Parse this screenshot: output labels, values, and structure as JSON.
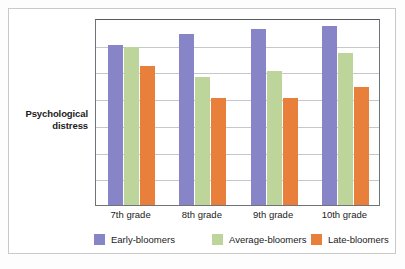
{
  "figure": {
    "background": "#ffffff",
    "frame_color": "#c9c9c9",
    "axis_color": "#6f7276",
    "grid_color": "#c4c8cc"
  },
  "y_axis_label": "Psychological\ndistress",
  "y_axis_label_line1": "Psychological",
  "y_axis_label_line2": "distress",
  "legend": {
    "position": "bottom",
    "items": [
      {
        "label": "Early-bloomers",
        "color": "#8884c8",
        "name": "legend-item-early-bloomers"
      },
      {
        "label": "Average-bloomers",
        "color": "#bdd49a",
        "name": "legend-item-average-bloomers"
      },
      {
        "label": "Late-bloomers",
        "color": "#e8803c",
        "name": "legend-item-late-bloomers"
      }
    ]
  },
  "chart_data": {
    "type": "bar",
    "title": "",
    "xlabel": "",
    "ylabel": "Psychological distress",
    "categories": [
      "7th grade",
      "8th grade",
      "9th grade",
      "10th grade"
    ],
    "ylim": [
      0,
      7
    ],
    "grid": true,
    "grid_lines": 7,
    "y_tick_labels": [],
    "legend_position": "bottom",
    "series": [
      {
        "name": "Early-bloomers",
        "color": "#8884c8",
        "values": [
          6.0,
          6.4,
          6.6,
          6.7
        ]
      },
      {
        "name": "Average-bloomers",
        "color": "#bdd49a",
        "values": [
          5.9,
          4.8,
          5.0,
          5.7
        ]
      },
      {
        "name": "Late-bloomers",
        "color": "#e8803c",
        "values": [
          5.2,
          4.0,
          4.0,
          4.4
        ]
      }
    ]
  }
}
